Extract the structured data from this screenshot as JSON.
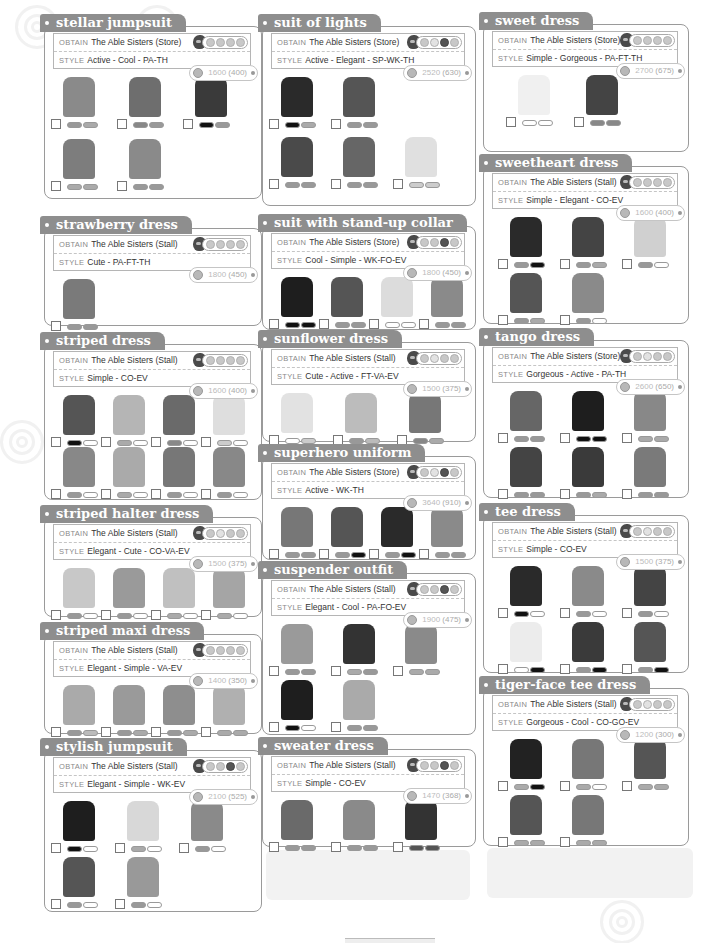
{
  "labels": {
    "obtain": "OBTAIN",
    "style": "STYLE"
  },
  "colors": {
    "tab_bg": "#8e8e8e",
    "border": "#9a9a9a",
    "page_bg": "#ffffff"
  },
  "entries": [
    {
      "id": "stellar-jumpsuit",
      "title": "stellar jumpsuit",
      "obtain": "The Able Sisters (Store)",
      "style": "Active - Cool - PA-TH",
      "price": "1600",
      "sell": "(400)",
      "circles": [
        "m",
        "m",
        "m",
        "m"
      ],
      "variants": [
        [
          "#8a8a8a",
          "#999",
          "#aaa"
        ],
        [
          "#6e6e6e",
          "#888",
          "#999"
        ],
        [
          "#3a3a3a",
          "#111",
          "#999"
        ],
        [
          "#7d7d7d",
          "#aaa",
          "#aaa"
        ],
        [
          "#8a8a8a",
          "#999",
          "#999"
        ]
      ]
    },
    {
      "id": "strawberry-dress",
      "title": "strawberry dress",
      "obtain": "The Able Sisters (Stall)",
      "style": "Cute - PA-FT-TH",
      "price": "1800",
      "sell": "(450)",
      "circles": [
        "m",
        "m",
        "m",
        "m"
      ],
      "variants": [
        [
          "#7a7a7a",
          "#999",
          "#999"
        ]
      ]
    },
    {
      "id": "striped-dress",
      "title": "striped dress",
      "obtain": "The Able Sisters (Stall)",
      "style": "Simple - CO-EV",
      "price": "1600",
      "sell": "(400)",
      "circles": [
        "m",
        "m",
        "m",
        "m"
      ],
      "variants": [
        [
          "#555",
          "#111",
          "#fff"
        ],
        [
          "#b5b5b5",
          "#aaa",
          "#fff"
        ],
        [
          "#6a6a6a",
          "#888",
          "#fff"
        ],
        [
          "#dedede",
          "#ccc",
          "#fff"
        ],
        [
          "#888",
          "#999",
          "#fff"
        ],
        [
          "#aaa",
          "#aaa",
          "#fff"
        ],
        [
          "#777",
          "#999",
          "#fff"
        ],
        [
          "#888",
          "#999",
          "#fff"
        ]
      ]
    },
    {
      "id": "striped-halter-dress",
      "title": "striped halter dress",
      "obtain": "The Able Sisters (Stall)",
      "style": "Elegant - Cute - CO-VA-EV",
      "price": "1500",
      "sell": "(375)",
      "circles": [
        "m",
        "l",
        "m",
        "m"
      ],
      "variants": [
        [
          "#c8c8c8",
          "#999",
          "#fff"
        ],
        [
          "#9a9a9a",
          "#999",
          "#fff"
        ],
        [
          "#c0c0c0",
          "#aaa",
          "#fff"
        ],
        [
          "#a5a5a5",
          "#aaa",
          "#fff"
        ]
      ]
    },
    {
      "id": "striped-maxi-dress",
      "title": "striped maxi dress",
      "obtain": "The Able Sisters (Stall)",
      "style": "Elegant - Simple - VA-EV",
      "price": "1400",
      "sell": "(350)",
      "circles": [
        "m",
        "m",
        "m",
        "m"
      ],
      "variants": [
        [
          "#aaa",
          "#999",
          "#bbb"
        ],
        [
          "#9a9a9a",
          "#999",
          "#aaa"
        ],
        [
          "#8e8e8e",
          "#999",
          "#aaa"
        ],
        [
          "#b0b0b0",
          "#aaa",
          "#aaa"
        ]
      ]
    },
    {
      "id": "stylish-jumpsuit",
      "title": "stylish jumpsuit",
      "obtain": "The Able Sisters (Stall)",
      "style": "Elegant - Simple - WK-EV",
      "price": "2100",
      "sell": "(525)",
      "circles": [
        "m",
        "m",
        "d",
        "m"
      ],
      "variants": [
        [
          "#1e1e1e",
          "#111",
          "#fff"
        ],
        [
          "#d8d8d8",
          "#aaa",
          "#fff"
        ],
        [
          "#8a8a8a",
          "#999",
          "#fff"
        ],
        [
          "#555",
          "#999",
          "#fff"
        ],
        [
          "#999",
          "#999",
          "#fff"
        ]
      ]
    },
    {
      "id": "suit-of-lights",
      "title": "suit of lights",
      "obtain": "The Able Sisters (Store)",
      "style": "Active - Elegant - SP-WK-TH",
      "price": "2520",
      "sell": "(630)",
      "circles": [
        "m",
        "l",
        "d",
        "m"
      ],
      "variants": [
        [
          "#2a2a2a",
          "#111",
          "#aaa"
        ],
        [
          "#555",
          "#999",
          "#999"
        ],
        [
          "#4a4a4a",
          "#999",
          "#999"
        ],
        [
          "#666",
          "#999",
          "#999"
        ],
        [
          "#e0e0e0",
          "#ccc",
          "#ccc"
        ]
      ]
    },
    {
      "id": "suit-with-stand-up-collar",
      "title": "suit with stand-up collar",
      "obtain": "The Able Sisters (Store)",
      "style": "Cool - Simple - WK-FO-EV",
      "price": "1800",
      "sell": "(450)",
      "circles": [
        "m",
        "m",
        "d",
        "m"
      ],
      "variants": [
        [
          "#1e1e1e",
          "#111",
          "#111"
        ],
        [
          "#555",
          "#999",
          "#999"
        ],
        [
          "#dcdcdc",
          "#fff",
          "#fff"
        ],
        [
          "#8a8a8a",
          "#999",
          "#999"
        ]
      ]
    },
    {
      "id": "sunflower-dress",
      "title": "sunflower dress",
      "obtain": "The Able Sisters (Stall)",
      "style": "Cute - Active - FT-VA-EV",
      "price": "1500",
      "sell": "(375)",
      "circles": [
        "m",
        "l",
        "m",
        "m"
      ],
      "variants": [
        [
          "#e2e2e2",
          "#fff",
          "#ccc"
        ],
        [
          "#bcbcbc",
          "#999",
          "#bbb"
        ],
        [
          "#777",
          "#888",
          "#aaa"
        ]
      ]
    },
    {
      "id": "superhero-uniform",
      "title": "superhero uniform",
      "obtain": "The Able Sisters (Store)",
      "style": "Active - WK-TH",
      "price": "3640",
      "sell": "(910)",
      "circles": [
        "m",
        "l",
        "d",
        "m"
      ],
      "variants": [
        [
          "#777",
          "#999",
          "#999"
        ],
        [
          "#555",
          "#999",
          "#111"
        ],
        [
          "#2a2a2a",
          "#999",
          "#111"
        ],
        [
          "#8a8a8a",
          "#999",
          "#999"
        ]
      ]
    },
    {
      "id": "suspender-outfit",
      "title": "suspender outfit",
      "obtain": "The Able Sisters (Stall)",
      "style": "Elegant - Cool - PA-FO-EV",
      "price": "1900",
      "sell": "(475)",
      "circles": [
        "m",
        "m",
        "d",
        "m"
      ],
      "variants": [
        [
          "#9a9a9a",
          "#999",
          "#999"
        ],
        [
          "#333",
          "#aaa",
          "#999"
        ],
        [
          "#8a8a8a",
          "#aaa",
          "#aaa"
        ],
        [
          "#1e1e1e",
          "#111",
          "#fff"
        ],
        [
          "#aaa",
          "#999",
          "#999"
        ]
      ]
    },
    {
      "id": "sweater-dress",
      "title": "sweater dress",
      "obtain": "The Able Sisters (Stall)",
      "style": "Simple - CO-EV",
      "price": "1470",
      "sell": "(368)",
      "circles": [
        "m",
        "m",
        "d",
        "m"
      ],
      "variants": [
        [
          "#6a6a6a",
          "#999",
          "#999"
        ],
        [
          "#8a8a8a",
          "#999",
          "#999"
        ],
        [
          "#333",
          "#555",
          "#555"
        ]
      ]
    },
    {
      "id": "sweet-dress",
      "title": "sweet dress",
      "obtain": "The Able Sisters (Store)",
      "style": "Simple - Gorgeous - PA-FT-TH",
      "price": "2700",
      "sell": "(675)",
      "circles": [
        "m",
        "m",
        "m",
        "m"
      ],
      "variants": [
        [
          "#f0f0f0",
          "#fff",
          "#fff"
        ],
        [
          "#444",
          "#888",
          "#888"
        ]
      ]
    },
    {
      "id": "sweetheart-dress",
      "title": "sweetheart dress",
      "obtain": "The Able Sisters (Stall)",
      "style": "Simple - Elegant - CO-EV",
      "price": "1600",
      "sell": "(400)",
      "circles": [
        "m",
        "m",
        "m",
        "m"
      ],
      "variants": [
        [
          "#2a2a2a",
          "#999",
          "#111"
        ],
        [
          "#444",
          "#999",
          "#aaa"
        ],
        [
          "#d0d0d0",
          "#999",
          "#fff"
        ],
        [
          "#555",
          "#999",
          "#aaa"
        ],
        [
          "#8a8a8a",
          "#999",
          "#fff"
        ]
      ]
    },
    {
      "id": "tango-dress",
      "title": "tango dress",
      "obtain": "The Able Sisters (Store)",
      "style": "Gorgeous - Active - PA-TH",
      "price": "2600",
      "sell": "(650)",
      "circles": [
        "m",
        "l",
        "m",
        "m"
      ],
      "variants": [
        [
          "#666",
          "#999",
          "#999"
        ],
        [
          "#1e1e1e",
          "#111",
          "#111"
        ],
        [
          "#888",
          "#aaa",
          "#aaa"
        ],
        [
          "#444",
          "#999",
          "#999"
        ],
        [
          "#3a3a3a",
          "#999",
          "#aaa"
        ],
        [
          "#7a7a7a",
          "#999",
          "#999"
        ]
      ]
    },
    {
      "id": "tee-dress",
      "title": "tee dress",
      "obtain": "The Able Sisters (Stall)",
      "style": "Simple - CO-EV",
      "price": "1500",
      "sell": "(375)",
      "circles": [
        "m",
        "l",
        "m",
        "m"
      ],
      "variants": [
        [
          "#2a2a2a",
          "#111",
          "#fff"
        ],
        [
          "#8a8a8a",
          "#999",
          "#fff"
        ],
        [
          "#444",
          "#999",
          "#fff"
        ],
        [
          "#ececec",
          "#fff",
          "#111"
        ],
        [
          "#3a3a3a",
          "#999",
          "#111"
        ],
        [
          "#555",
          "#999",
          "#111"
        ]
      ]
    },
    {
      "id": "tiger-face-tee-dress",
      "title": "tiger-face tee dress",
      "obtain": "The Able Sisters (Stall)",
      "style": "Gorgeous - Cool - CO-GO-EV",
      "price": "1200",
      "sell": "(300)",
      "circles": [
        "m",
        "l",
        "m",
        "m"
      ],
      "variants": [
        [
          "#222",
          "#aaa",
          "#111"
        ],
        [
          "#777",
          "#aaa",
          "#fff"
        ],
        [
          "#555",
          "#aaa",
          "#aaa"
        ],
        [
          "#555",
          "#aaa",
          "#aaa"
        ],
        [
          "#777",
          "#aaa",
          "#aaa"
        ]
      ]
    }
  ]
}
